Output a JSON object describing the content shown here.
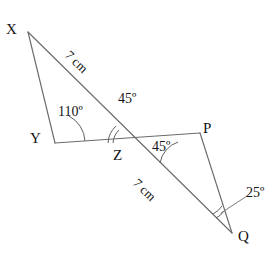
{
  "figure": {
    "type": "geometry-diagram",
    "background_color": "#ffffff",
    "line_color": "#6b6b6b",
    "text_color": "#141414"
  },
  "vertices": [
    {
      "name": "X",
      "label": "X",
      "x": 28,
      "y": 32
    },
    {
      "name": "Y",
      "label": "Y",
      "x": 55,
      "y": 143
    },
    {
      "name": "Z",
      "label": "Z",
      "x": 133,
      "y": 143
    },
    {
      "name": "P",
      "label": "P",
      "x": 200,
      "y": 133
    },
    {
      "name": "Q",
      "label": "Q",
      "x": 232,
      "y": 233
    }
  ],
  "segments": [
    {
      "name": "segment-XY",
      "from": "X",
      "to": "Y"
    },
    {
      "name": "segment-XQ",
      "from": "X",
      "to": "Q"
    },
    {
      "name": "segment-YP",
      "from": "Y",
      "to": "P"
    },
    {
      "name": "segment-PQ",
      "from": "P",
      "to": "Q"
    }
  ],
  "angles": [
    {
      "name": "angle-at-Y",
      "label": "110º",
      "vertex": "Y",
      "value": 110
    },
    {
      "name": "angle-upper-at-Z",
      "label": "45º",
      "vertex": "Z",
      "value": 45
    },
    {
      "name": "angle-lower-at-Z",
      "label": "45º",
      "vertex": "Z",
      "value": 45
    },
    {
      "name": "angle-at-Q",
      "label": "25º",
      "vertex": "Q",
      "value": 25
    }
  ],
  "lengths": [
    {
      "name": "length-XZ",
      "label": "7 cm",
      "value": 7,
      "unit": "cm",
      "segment": "X-Z"
    },
    {
      "name": "length-ZQ",
      "label": "7 cm",
      "value": 7,
      "unit": "cm",
      "segment": "Z-Q"
    }
  ]
}
